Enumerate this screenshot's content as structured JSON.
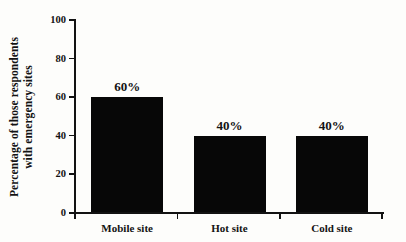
{
  "page": {
    "background": "#fdfdfb"
  },
  "chart_data": {
    "type": "bar",
    "title": "",
    "categories": [
      "Mobile site",
      "Hot site",
      "Cold site"
    ],
    "values": [
      60,
      40,
      40
    ],
    "bar_labels": [
      "60%",
      "40%",
      "40%"
    ],
    "xlabel": "",
    "ylabel": "Percentage of those respondents with emergency sites",
    "ylabel_lines": [
      "Percentage of those respondents",
      "with emergency sites"
    ],
    "yticks": [
      "0",
      "20",
      "40",
      "60",
      "80",
      "100"
    ],
    "ytick_values": [
      0,
      20,
      40,
      60,
      80,
      100
    ],
    "ylim": [
      0,
      100
    ],
    "grid": false,
    "legend": "none",
    "bar_color": "#070707",
    "axis_color": "#121212",
    "text_color": "#131313"
  }
}
